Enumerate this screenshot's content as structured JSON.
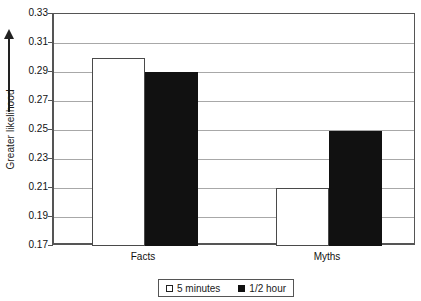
{
  "chart_data": {
    "type": "bar",
    "title": "",
    "xlabel": "",
    "ylabel": "Greater likelihood",
    "categories": [
      "Facts",
      "Myths"
    ],
    "series": [
      {
        "name": "5 minutes",
        "values": [
          0.3,
          0.21
        ],
        "color": "#ffffff"
      },
      {
        "name": "1/2 hour",
        "values": [
          0.29,
          0.2495
        ],
        "color": "#111111"
      }
    ],
    "ylim": [
      0.17,
      0.33
    ],
    "ytick_step": 0.02,
    "ytick_labels": [
      "0.33",
      "0.31",
      "0.29",
      "0.27",
      "0.25",
      "0.23",
      "0.21",
      "0.19",
      "0.17"
    ],
    "ytick_values": [
      0.33,
      0.31,
      0.29,
      0.27,
      0.25,
      0.23,
      0.21,
      0.19,
      0.17
    ],
    "grid": true,
    "legend_position": "bottom",
    "axis_arrow": "up"
  },
  "legend": {
    "items": [
      {
        "label": "5 minutes",
        "marker": "white-square"
      },
      {
        "label": "1/2 hour",
        "marker": "black-square"
      }
    ]
  },
  "colors": {
    "axis": "#555555",
    "grid": "#a8a8a8",
    "bar_light": "#ffffff",
    "bar_dark": "#111111",
    "text": "#111111"
  }
}
